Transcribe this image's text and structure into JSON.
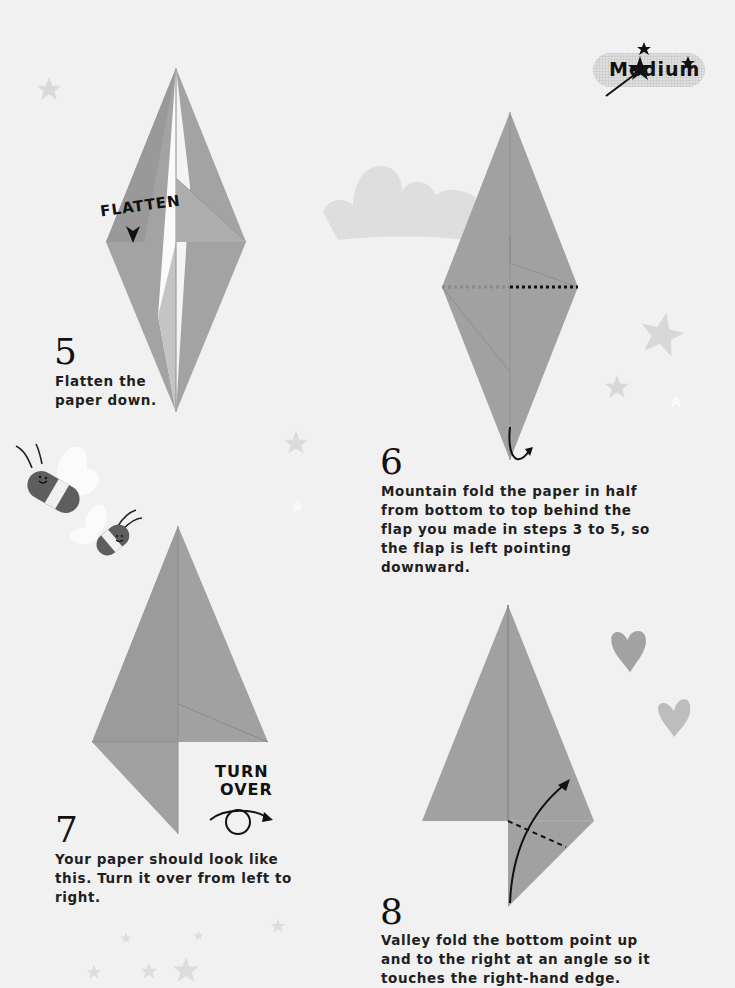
{
  "difficulty_badge": {
    "label": "Medium",
    "icon": "magic-wand-icon"
  },
  "colors": {
    "background": "#f1f1f1",
    "paper": "#9e9e9e",
    "paper_light": "#b4b4b4",
    "paper_dark": "#8c8c8c",
    "ink": "#111111",
    "decor": "#dcdcdc"
  },
  "steps": [
    {
      "number": "5",
      "text": "Flatten the paper down.",
      "callout": "FLATTEN",
      "callout_icon": "down-arrow-icon"
    },
    {
      "number": "6",
      "text": "Mountain fold the paper in half from bottom to top behind the flap you made in steps 3 to 5, so the flap is left pointing downward.",
      "fold_line": "mountain-fold-dotted",
      "arrow_icon": "curved-arrow-icon"
    },
    {
      "number": "7",
      "text": "Your paper should look like this. Turn it over from left to right.",
      "callout_line1": "TURN",
      "callout_line2": "OVER",
      "callout_icon": "turn-over-icon"
    },
    {
      "number": "8",
      "text": "Valley fold the bottom point up and to the right at an angle so it touches the right-hand edge.",
      "fold_line": "valley-fold-dashed",
      "arrow_icon": "curved-arrow-icon"
    }
  ],
  "decorations": [
    "star-icon",
    "cloud-icon",
    "bee-icon",
    "heart-icon"
  ]
}
